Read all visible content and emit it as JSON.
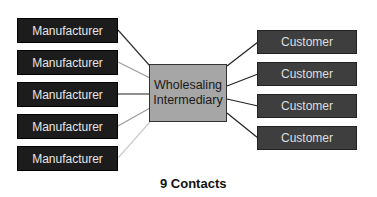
{
  "diagram": {
    "manufacturers": [
      {
        "label": "Manufacturer"
      },
      {
        "label": "Manufacturer"
      },
      {
        "label": "Manufacturer"
      },
      {
        "label": "Manufacturer"
      },
      {
        "label": "Manufacturer"
      }
    ],
    "intermediary": {
      "line1": "Wholesaling",
      "line2": "Intermediary"
    },
    "customers": [
      {
        "label": "Customer"
      },
      {
        "label": "Customer"
      },
      {
        "label": "Customer"
      },
      {
        "label": "Customer"
      }
    ],
    "caption": "9 Contacts"
  }
}
